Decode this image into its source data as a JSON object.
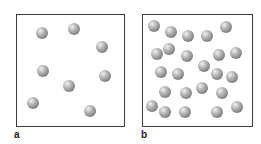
{
  "figure": {
    "panels": [
      {
        "label": "a",
        "box": {
          "left": 16,
          "top": 14,
          "width": 109,
          "height": 113
        },
        "label_pos": {
          "x": 14,
          "y": 130
        },
        "particle_count": 8,
        "particles": [
          {
            "x": 42,
            "y": 33
          },
          {
            "x": 74,
            "y": 29
          },
          {
            "x": 102,
            "y": 47
          },
          {
            "x": 43,
            "y": 71
          },
          {
            "x": 105,
            "y": 76
          },
          {
            "x": 69,
            "y": 86
          },
          {
            "x": 33,
            "y": 103
          },
          {
            "x": 90,
            "y": 111
          }
        ]
      },
      {
        "label": "b",
        "box": {
          "left": 142,
          "top": 14,
          "width": 111,
          "height": 113
        },
        "label_pos": {
          "x": 141,
          "y": 130
        },
        "particle_count": 28,
        "particles": [
          {
            "x": 154,
            "y": 26
          },
          {
            "x": 171,
            "y": 32
          },
          {
            "x": 188,
            "y": 36
          },
          {
            "x": 207,
            "y": 36
          },
          {
            "x": 226,
            "y": 27
          },
          {
            "x": 169,
            "y": 49
          },
          {
            "x": 157,
            "y": 54
          },
          {
            "x": 187,
            "y": 56
          },
          {
            "x": 219,
            "y": 55
          },
          {
            "x": 236,
            "y": 53
          },
          {
            "x": 161,
            "y": 72
          },
          {
            "x": 178,
            "y": 74
          },
          {
            "x": 204,
            "y": 66
          },
          {
            "x": 217,
            "y": 74
          },
          {
            "x": 232,
            "y": 77
          },
          {
            "x": 165,
            "y": 92
          },
          {
            "x": 186,
            "y": 93
          },
          {
            "x": 202,
            "y": 88
          },
          {
            "x": 222,
            "y": 93
          },
          {
            "x": 152,
            "y": 106
          },
          {
            "x": 165,
            "y": 112
          },
          {
            "x": 185,
            "y": 112
          },
          {
            "x": 217,
            "y": 112
          },
          {
            "x": 237,
            "y": 107
          }
        ]
      }
    ],
    "colors": {
      "border": "#3a3a3a",
      "particle": "#8a8a8a",
      "background": "#ffffff"
    }
  }
}
